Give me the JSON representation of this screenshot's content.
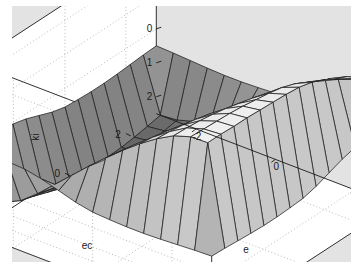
{
  "figure": {
    "background_color": "#e3e3e3",
    "plot_wall_color": "#ffffff",
    "axis_line_color": "#1a1a1a",
    "grid_color": "#8a8a8a",
    "mesh_line_color": "#1f1f1f",
    "surface_light_color": "#f2f2f2",
    "surface_dark_color": "#5a5a5a"
  },
  "chart_data": {
    "type": "surface",
    "title": "",
    "xlabel": "e",
    "ylabel": "ec",
    "zlabel": "ki",
    "xlim": [
      -3,
      3
    ],
    "ylim": [
      -3,
      3
    ],
    "zlim": [
      -2.5,
      2.5
    ],
    "xticks": [
      -2,
      0,
      2
    ],
    "yticks": [
      -2,
      0,
      2
    ],
    "zticks": [
      -2,
      -1,
      0,
      1,
      2
    ],
    "xtick_labels": [
      "-2",
      "0",
      "2"
    ],
    "ytick_labels": [
      "2",
      "0",
      "-2"
    ],
    "ztick_labels": [
      "2",
      "1",
      "0",
      "-1",
      "-2"
    ],
    "grid": true,
    "legend": false,
    "colormap": "gray",
    "shading": "faceted",
    "view_azimuth": -37.5,
    "view_elevation": 30,
    "grid_n": 15,
    "x": [
      -3,
      -2.571,
      -2.143,
      -1.714,
      -1.286,
      -0.857,
      -0.429,
      0,
      0.429,
      0.857,
      1.286,
      1.714,
      2.143,
      2.571,
      3
    ],
    "y": [
      -3,
      -2.571,
      -2.143,
      -1.714,
      -1.286,
      -0.857,
      -0.429,
      0,
      0.429,
      0.857,
      1.286,
      1.714,
      2.143,
      2.571,
      3
    ],
    "z_description": "ki = fuzzy control surface, monotonic increasing with e and ec, saturating plateaus at +/-2 near the corners, shallow valley at front corner (e=-2, ec=-2) reaching about -2.4, high plateau at back corner (e=2, ec=2) reaching about 2.3, with narrow flat shelves at z about -0.5 protruding at the left and right extremes",
    "z": [
      [
        -0.5,
        -0.52,
        -0.55,
        -0.58,
        -0.6,
        -0.6,
        -0.58,
        -0.55,
        -0.45,
        -0.3,
        -0.15,
        -0.05,
        -0.02,
        -0.01,
        -0.5
      ],
      [
        -0.52,
        -2.1,
        -2.05,
        -1.9,
        -1.65,
        -1.35,
        -1.0,
        -0.62,
        -0.2,
        0.2,
        0.58,
        0.9,
        1.15,
        1.3,
        -0.01
      ],
      [
        -0.55,
        -2.18,
        -2.12,
        -1.96,
        -1.7,
        -1.38,
        -1.02,
        -0.62,
        -0.18,
        0.25,
        0.66,
        1.02,
        1.32,
        1.52,
        -0.02
      ],
      [
        -0.58,
        -2.25,
        -2.18,
        -2.0,
        -1.72,
        -1.38,
        -1.0,
        -0.58,
        -0.12,
        0.34,
        0.78,
        1.18,
        1.52,
        1.76,
        -0.05
      ],
      [
        -0.6,
        -2.3,
        -2.22,
        -2.02,
        -1.72,
        -1.35,
        -0.95,
        -0.5,
        -0.02,
        0.46,
        0.92,
        1.36,
        1.74,
        2.0,
        -0.15
      ],
      [
        -0.6,
        -2.32,
        -2.22,
        -2.0,
        -1.66,
        -1.26,
        -0.84,
        -0.38,
        0.1,
        0.6,
        1.08,
        1.54,
        1.94,
        2.18,
        -0.3
      ],
      [
        -0.58,
        -2.3,
        -2.18,
        -1.92,
        -1.56,
        -1.14,
        -0.7,
        -0.22,
        0.26,
        0.76,
        1.24,
        1.7,
        2.08,
        2.28,
        -0.45
      ],
      [
        -0.55,
        -2.26,
        -2.12,
        -1.84,
        -1.44,
        -1.0,
        -0.54,
        -0.05,
        0.44,
        0.92,
        1.38,
        1.82,
        2.16,
        2.32,
        -0.55
      ],
      [
        -0.45,
        -2.2,
        -2.04,
        -1.72,
        -1.3,
        -0.84,
        -0.36,
        0.12,
        0.6,
        1.08,
        1.52,
        1.92,
        2.22,
        2.34,
        -0.58
      ],
      [
        -0.3,
        -2.12,
        -1.94,
        -1.58,
        -1.14,
        -0.66,
        -0.18,
        0.3,
        0.78,
        1.24,
        1.66,
        2.02,
        2.28,
        2.36,
        -0.6
      ],
      [
        -0.15,
        -2.02,
        -1.82,
        -1.44,
        -0.98,
        -0.5,
        -0.02,
        0.46,
        0.92,
        1.36,
        1.76,
        2.1,
        2.32,
        2.38,
        -0.6
      ],
      [
        -0.05,
        -1.9,
        -1.68,
        -1.28,
        -0.82,
        -0.34,
        0.14,
        0.6,
        1.04,
        1.46,
        1.84,
        2.16,
        2.34,
        2.38,
        -0.58
      ],
      [
        -0.02,
        -1.78,
        -1.54,
        -1.14,
        -0.68,
        -0.2,
        0.26,
        0.72,
        1.14,
        1.54,
        1.9,
        2.2,
        2.36,
        2.4,
        -0.55
      ],
      [
        -0.01,
        -1.66,
        -1.42,
        -1.02,
        -0.56,
        -0.1,
        0.36,
        0.8,
        1.22,
        1.6,
        1.94,
        2.22,
        2.38,
        2.4,
        -0.52
      ],
      [
        -0.5,
        -0.01,
        -0.02,
        -0.05,
        -0.15,
        -0.3,
        -0.45,
        -0.55,
        -0.58,
        -0.6,
        -0.6,
        -0.58,
        -0.55,
        -0.52,
        -0.5
      ]
    ]
  }
}
